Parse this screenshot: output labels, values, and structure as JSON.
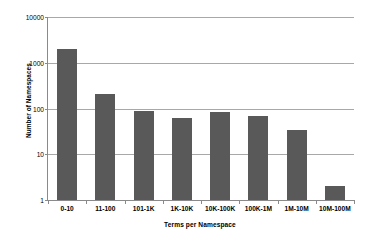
{
  "chart_data": {
    "type": "bar",
    "title": "",
    "xlabel": "Terms per Namespace",
    "ylabel": "Number of Namespaces",
    "categories": [
      "0-10",
      "11-100",
      "101-1K",
      "1K-10K",
      "10K-100K",
      "100K-1M",
      "1M-10M",
      "10M-100M"
    ],
    "values": [
      2000,
      210,
      88,
      62,
      85,
      70,
      34,
      2
    ],
    "yscale": "log",
    "ylim": [
      1,
      10000
    ],
    "ytick_labels": [
      "1",
      "10",
      "100",
      "1000",
      "10000"
    ],
    "ytick_values": [
      1,
      10,
      100,
      1000,
      10000
    ],
    "grid": "horizontal",
    "legend": "none",
    "bar_color": "#595959",
    "gridline_color": "#a8a8a8",
    "axis_color": "#8a8a8a",
    "background": "#ffffff"
  }
}
